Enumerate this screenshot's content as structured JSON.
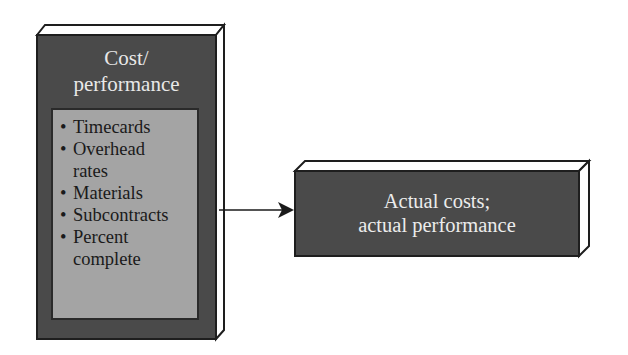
{
  "diagram": {
    "source_box": {
      "title_lines": [
        "Cost/",
        "performance"
      ],
      "items": [
        {
          "lines": [
            "Timecards"
          ]
        },
        {
          "lines": [
            "Overhead",
            "rates"
          ]
        },
        {
          "lines": [
            "Materials"
          ]
        },
        {
          "lines": [
            "Subcontracts"
          ]
        },
        {
          "lines": [
            "Percent",
            "complete"
          ]
        }
      ]
    },
    "target_box": {
      "lines": [
        "Actual costs;",
        "actual performance"
      ]
    },
    "connector": {
      "from": "source_box",
      "to": "target_box",
      "type": "arrow"
    },
    "colors": {
      "dark_box": "#4a4a4a",
      "inner_box": "#a4a4a4",
      "border": "#1e1e1e",
      "background": "#ffffff"
    }
  }
}
